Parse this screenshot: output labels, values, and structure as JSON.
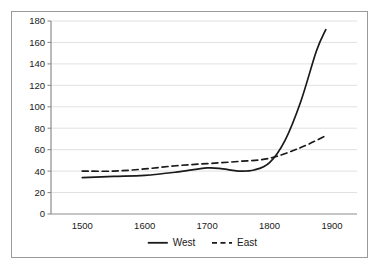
{
  "chart_data": {
    "type": "line",
    "title": "",
    "xlabel": "",
    "ylabel": "",
    "xlim": [
      1450,
      1940
    ],
    "ylim": [
      0,
      180
    ],
    "grid": true,
    "legend_position": "bottom-center",
    "x_ticks": [
      "1500",
      "1600",
      "1700",
      "1800",
      "1900"
    ],
    "x_tick_values": [
      1500,
      1600,
      1700,
      1800,
      1900
    ],
    "y_ticks": [
      "0",
      "20",
      "40",
      "60",
      "80",
      "100",
      "120",
      "140",
      "160",
      "180"
    ],
    "y_tick_values": [
      0,
      20,
      40,
      60,
      80,
      100,
      120,
      140,
      160,
      180
    ],
    "series": [
      {
        "name": "West",
        "style": "solid",
        "color": "#1a1a1a",
        "x": [
          1500,
          1550,
          1600,
          1650,
          1700,
          1725,
          1750,
          1775,
          1800,
          1825,
          1850,
          1875,
          1890
        ],
        "values": [
          34,
          35,
          36,
          39,
          43,
          42,
          40,
          41,
          48,
          69,
          105,
          152,
          172
        ]
      },
      {
        "name": "East",
        "style": "dashed",
        "color": "#1a1a1a",
        "x": [
          1500,
          1550,
          1600,
          1650,
          1700,
          1750,
          1800,
          1850,
          1890
        ],
        "values": [
          40,
          40,
          42,
          45,
          47,
          49,
          52,
          62,
          73
        ]
      }
    ]
  },
  "legend": {
    "items": [
      {
        "label": "West",
        "style": "solid"
      },
      {
        "label": "East",
        "style": "dashed"
      }
    ]
  }
}
